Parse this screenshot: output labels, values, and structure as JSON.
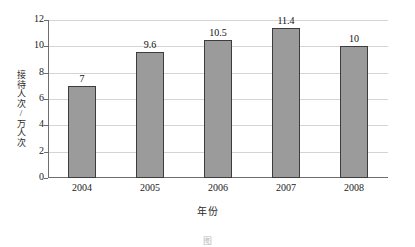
{
  "chart_data": {
    "type": "bar",
    "title": "",
    "xlabel": "年份",
    "ylabel": "接待人次/万人次",
    "categories": [
      "2004",
      "2005",
      "2006",
      "2007",
      "2008"
    ],
    "values": [
      7,
      9.6,
      10.5,
      11.4,
      10
    ],
    "value_labels": [
      "7",
      "9.6",
      "10.5",
      "11.4",
      "10"
    ],
    "ylim": [
      0,
      12
    ],
    "yticks": [
      0,
      2,
      4,
      6,
      8,
      10,
      12
    ],
    "ytick_labels": [
      "0",
      "2",
      "4",
      "6",
      "8",
      "10",
      "12"
    ],
    "grid": true,
    "legend": false,
    "legend_position": "none",
    "bar_color": "#9b9b9b",
    "bar_border_color": "#3d3d3d",
    "gridline_color": "#d4d4d4",
    "axis_color": "#6e6e6e",
    "background_color": "#ffffff"
  },
  "caption": {
    "text": "图"
  }
}
